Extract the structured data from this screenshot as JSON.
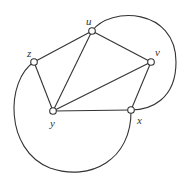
{
  "diagram": {
    "type": "graph",
    "colors": {
      "stroke": "#333333",
      "background": "#ffffff",
      "node_fill": "#ffffff"
    },
    "nodes": [
      {
        "id": "u",
        "label": "u",
        "x": 92,
        "y": 31,
        "lx": 86,
        "ly": 25
      },
      {
        "id": "z",
        "label": "z",
        "x": 34,
        "y": 62,
        "lx": 27,
        "ly": 57
      },
      {
        "id": "v",
        "label": "v",
        "x": 151,
        "y": 62,
        "lx": 155,
        "ly": 56
      },
      {
        "id": "y",
        "label": "y",
        "x": 53,
        "y": 111,
        "lx": 50,
        "ly": 127
      },
      {
        "id": "x",
        "label": "x",
        "x": 131,
        "y": 110,
        "lx": 137,
        "ly": 124
      }
    ],
    "edges": [
      {
        "from": "z",
        "to": "u"
      },
      {
        "from": "u",
        "to": "v"
      },
      {
        "from": "u",
        "to": "y"
      },
      {
        "from": "z",
        "to": "y"
      },
      {
        "from": "y",
        "to": "v"
      },
      {
        "from": "y",
        "to": "x"
      },
      {
        "from": "v",
        "to": "x"
      },
      {
        "from": "u",
        "to": "x",
        "curved": true,
        "side": "right"
      },
      {
        "from": "z",
        "to": "x",
        "curved": true,
        "side": "lower-left"
      }
    ]
  }
}
